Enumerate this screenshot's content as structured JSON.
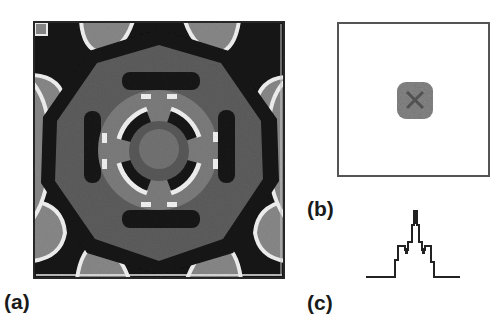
{
  "figure": {
    "panels": [
      {
        "id": "a",
        "label": "(a)",
        "description": "Grayscale 2D intensity pattern with four-fold symmetry: central gray disk, ring of dark arcs with white edges, four dark bars, large gray octagonal region ringed in black, light lobes at corners and edge midpoints"
      },
      {
        "id": "b",
        "label": "(b)",
        "description": "Framed empty field with a small gray square-ish spot at center"
      },
      {
        "id": "c",
        "label": "(c)",
        "description": "Stepped 1D intensity profile with central sharp peak and symmetric shoulders"
      }
    ]
  },
  "colors": {
    "black": "#141414",
    "dark_gray": "#2a2a2a",
    "mid_gray": "#5e5e5e",
    "center_gray": "#747474",
    "light_gray": "#8c8c8c",
    "ring_gray": "#7e7e7e",
    "white": "#f4f4f4",
    "spot_gray": "#7a7a7a",
    "frame": "#555555",
    "line": "#222222"
  },
  "profile_c": {
    "type": "line",
    "points": [
      [
        0,
        69
      ],
      [
        29,
        69
      ],
      [
        29,
        52
      ],
      [
        32,
        52
      ],
      [
        32,
        38
      ],
      [
        39,
        38
      ],
      [
        39,
        42
      ],
      [
        42,
        42
      ],
      [
        42,
        34
      ],
      [
        46,
        34
      ],
      [
        46,
        17
      ],
      [
        48,
        17
      ],
      [
        48,
        3
      ],
      [
        51,
        3
      ],
      [
        51,
        17
      ],
      [
        53,
        17
      ],
      [
        53,
        34
      ],
      [
        56,
        34
      ],
      [
        56,
        42
      ],
      [
        59,
        42
      ],
      [
        59,
        38
      ],
      [
        65,
        38
      ],
      [
        65,
        54
      ],
      [
        68,
        54
      ],
      [
        68,
        69
      ],
      [
        94,
        69
      ]
    ]
  }
}
